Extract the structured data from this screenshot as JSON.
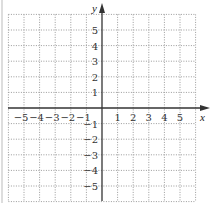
{
  "diagram": {
    "type": "coordinate-plane",
    "x_axis": {
      "label": "x",
      "min": -6,
      "max": 6,
      "tick_labels": [
        "-5",
        "-4",
        "-3",
        "-2",
        "-1",
        "1",
        "2",
        "3",
        "4",
        "5"
      ]
    },
    "y_axis": {
      "label": "y",
      "min": -6,
      "max": 6,
      "tick_labels": [
        "5",
        "4",
        "3",
        "2",
        "1",
        "-1",
        "-2",
        "-3",
        "-4",
        "-5"
      ]
    },
    "grid": {
      "style": "dotted",
      "spacing_units": 1,
      "color": "#9a9a9a"
    },
    "axis_color": "#333333"
  }
}
